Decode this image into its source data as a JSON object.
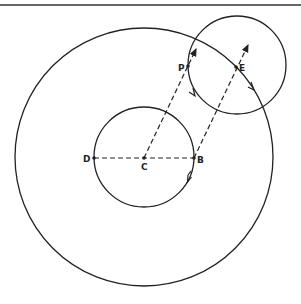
{
  "diagram": {
    "points": {
      "P": "P",
      "E": "E",
      "D": "D",
      "C": "C",
      "B": "B"
    },
    "elements": [
      {
        "type": "circle",
        "name": "outer-circle",
        "center": "C"
      },
      {
        "type": "circle",
        "name": "inner-circle",
        "center": "C"
      },
      {
        "type": "circle",
        "name": "small-circle",
        "center": "E"
      },
      {
        "type": "dashed-segment",
        "from": "D",
        "to": "B"
      },
      {
        "type": "dashed-arrow",
        "from": "C",
        "through": "P"
      },
      {
        "type": "dashed-arrow",
        "from": "B",
        "through": "E"
      }
    ],
    "stroke_color": "#222222"
  }
}
